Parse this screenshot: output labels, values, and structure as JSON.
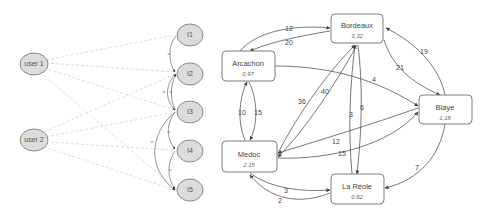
{
  "left_graph": {
    "users": [
      {
        "id": "user1",
        "label": "user 1"
      },
      {
        "id": "user2",
        "label": "user 2"
      }
    ],
    "items": [
      {
        "id": "i1",
        "label": "I1"
      },
      {
        "id": "i2",
        "label": "I2"
      },
      {
        "id": "i3",
        "label": "I3"
      },
      {
        "id": "i4",
        "label": "I4"
      },
      {
        "id": "i5",
        "label": "I5"
      }
    ],
    "item_edge_label": "w"
  },
  "right_graph": {
    "nodes": [
      {
        "id": "bordeaux",
        "name": "Bordeaux",
        "value": "3,32"
      },
      {
        "id": "arcachon",
        "name": "Arcachon",
        "value": "0,97"
      },
      {
        "id": "blaye",
        "name": "Blaye",
        "value": "1,18"
      },
      {
        "id": "medoc",
        "name": "Medoc",
        "value": "2,15"
      },
      {
        "id": "lareole",
        "name": "La Réole",
        "value": "0,62"
      }
    ],
    "edges": [
      {
        "from": "arcachon",
        "to": "bordeaux",
        "label": "12"
      },
      {
        "from": "bordeaux",
        "to": "arcachon",
        "label": "20"
      },
      {
        "from": "blaye",
        "to": "bordeaux",
        "label": "19"
      },
      {
        "from": "bordeaux",
        "to": "blaye",
        "label": "21"
      },
      {
        "from": "arcachon",
        "to": "blaye",
        "label": "4"
      },
      {
        "from": "arcachon",
        "to": "medoc",
        "label": "10"
      },
      {
        "from": "medoc",
        "to": "arcachon",
        "label": "15"
      },
      {
        "from": "medoc",
        "to": "bordeaux",
        "label": "36"
      },
      {
        "from": "bordeaux",
        "to": "medoc",
        "label": "40"
      },
      {
        "from": "lareole",
        "to": "bordeaux",
        "label": "3"
      },
      {
        "from": "bordeaux",
        "to": "lareole",
        "label": "6"
      },
      {
        "from": "blaye",
        "to": "medoc",
        "label": "12"
      },
      {
        "from": "medoc",
        "to": "blaye",
        "label": "15"
      },
      {
        "from": "blaye",
        "to": "lareole",
        "label": "7"
      },
      {
        "from": "medoc",
        "to": "lareole",
        "label": "3"
      },
      {
        "from": "lareole",
        "to": "medoc",
        "label": "2"
      }
    ]
  }
}
